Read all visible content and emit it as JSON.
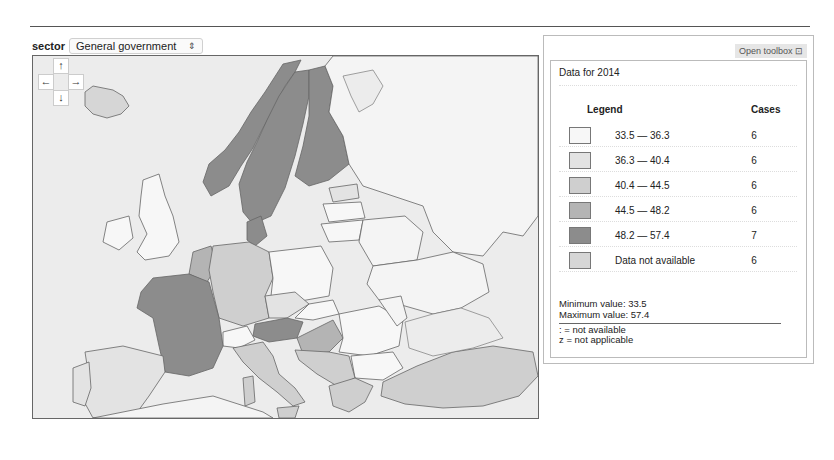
{
  "header": {
    "sector_label": "sector",
    "sector_value": "General government",
    "select_arrows": "⇕"
  },
  "map": {
    "nav": {
      "up": "↑",
      "left": "←",
      "right": "→",
      "down": "↓"
    },
    "colors": {
      "sea": "#ececec",
      "class1": "#f7f7f7",
      "class2": "#e3e3e3",
      "class3": "#cfcfcf",
      "class4": "#b4b4b4",
      "class5": "#8c8c8c",
      "na": "#d6d6d6",
      "nonmember": "#f4f4f4",
      "border": "#666666"
    }
  },
  "panel": {
    "toolbox_label": "Open toolbox ⊡",
    "title": "Data for 2014",
    "legend_header": "Legend",
    "cases_header": "Cases",
    "legend": [
      {
        "range": "33.5 — 36.3",
        "cases": "6",
        "color": "#f7f7f7"
      },
      {
        "range": "36.3 — 40.4",
        "cases": "6",
        "color": "#e3e3e3"
      },
      {
        "range": "40.4 — 44.5",
        "cases": "6",
        "color": "#cfcfcf"
      },
      {
        "range": "44.5 — 48.2",
        "cases": "6",
        "color": "#b4b4b4"
      },
      {
        "range": "48.2 — 57.4",
        "cases": "7",
        "color": "#8c8c8c"
      },
      {
        "range": "Data not available",
        "cases": "6",
        "color": "#d6d6d6"
      }
    ],
    "min_label": "Minimum value: 33.5",
    "max_label": "Maximum value: 57.4",
    "notes": [
      ": = not available",
      "z = not applicable"
    ]
  }
}
